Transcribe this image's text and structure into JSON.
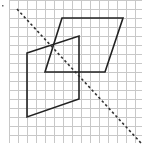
{
  "diagram": {
    "type": "grid-geometry",
    "background": "#ffffff",
    "grid": {
      "x0": 9,
      "y0": 0,
      "x1": 142,
      "y1": 143,
      "spacing": 9,
      "color": "#c8c8c8"
    },
    "stray_mark": {
      "x": 2,
      "y": 5,
      "color": "#666666"
    },
    "symmetry_line": {
      "style": "dashed",
      "color": "#333333",
      "from": [
        17,
        9
      ],
      "to": [
        141,
        143
      ]
    },
    "shapes": [
      {
        "name": "parallelogram-right",
        "color": "#222222",
        "points": [
          [
            62,
            18
          ],
          [
            123,
            18
          ],
          [
            105,
            72
          ],
          [
            45,
            72
          ]
        ]
      },
      {
        "name": "quadrilateral-left",
        "color": "#222222",
        "points": [
          [
            27,
            53
          ],
          [
            79,
            36
          ],
          [
            79,
            99
          ],
          [
            27,
            117
          ]
        ]
      }
    ]
  }
}
